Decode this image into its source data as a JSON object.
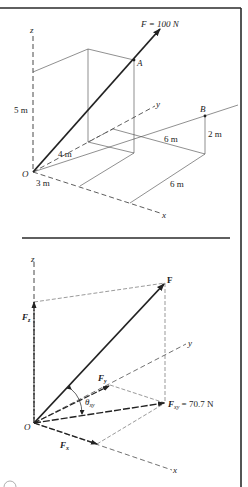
{
  "figure": {
    "frame": {
      "color": "#2a2a2a"
    },
    "top_panel": {
      "title": "3D position of force F from O through A, with point B",
      "force_label": "F = 100 N",
      "axis_labels": {
        "x": "x",
        "y": "y",
        "z": "z"
      },
      "point_labels": {
        "origin": "O",
        "A": "A",
        "B": "B"
      },
      "dimensions": {
        "height_z": "5 m",
        "along_y": "4 m",
        "along_x": "3 m",
        "B_offset_y": "6 m",
        "B_offset_x": "6 m",
        "B_height": "2 m"
      }
    },
    "bottom_panel": {
      "title": "Rectangular components of F",
      "axis_labels": {
        "x": "x",
        "y": "y",
        "z": "z"
      },
      "origin_label": "O",
      "vector_labels": {
        "F": "F",
        "Fz_main": "F",
        "Fz_sub": "z",
        "Fy_main": "F",
        "Fy_sub": "y",
        "Fx_main": "F",
        "Fx_sub": "x",
        "Fxy_main": "F",
        "Fxy_sub": "xy",
        "Fxy_value": " = 70.7 N"
      },
      "angle_label": {
        "main": "θ",
        "sub": "xy"
      }
    }
  }
}
